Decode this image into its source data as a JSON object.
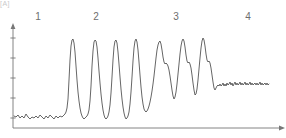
{
  "figure": {
    "corner_mark": "[A]",
    "width": 286,
    "height": 138
  },
  "zone_labels": [
    {
      "text": "1",
      "x": 38
    },
    {
      "text": "2",
      "x": 96
    },
    {
      "text": "3",
      "x": 176
    },
    {
      "text": "4",
      "x": 248
    }
  ],
  "axes": {
    "line_color": "#777777",
    "y_axis": {
      "x": 13,
      "top": 27,
      "bottom": 128
    },
    "x_axis": {
      "y": 128,
      "left": 13,
      "right": 281
    },
    "y_ticks": [
      38,
      58,
      78,
      98,
      118
    ],
    "arrowheads": true
  },
  "trace": {
    "color": "#555555",
    "width": 0.9
  },
  "chart_data": {
    "type": "line",
    "title": "",
    "xlabel": "",
    "ylabel": "",
    "grid": false,
    "legend": null,
    "annotations": [
      {
        "label": "1",
        "x": 38,
        "description": "baseline region"
      },
      {
        "label": "2",
        "x": 96,
        "description": "first peak group"
      },
      {
        "label": "3",
        "x": 176,
        "description": "second peak group"
      },
      {
        "label": "4",
        "x": 248,
        "description": "elevated plateau region"
      }
    ],
    "axis_pixel_ranges": {
      "x": [
        13,
        281
      ],
      "y_top": 27,
      "y_baseline": 128
    },
    "series": [
      {
        "name": "trace",
        "points": [
          [
            14,
            116
          ],
          [
            16,
            117
          ],
          [
            18,
            115
          ],
          [
            20,
            118
          ],
          [
            22,
            116
          ],
          [
            24,
            118
          ],
          [
            26,
            114
          ],
          [
            28,
            117
          ],
          [
            30,
            119
          ],
          [
            32,
            117
          ],
          [
            34,
            118
          ],
          [
            36,
            116
          ],
          [
            38,
            118
          ],
          [
            40,
            115
          ],
          [
            42,
            117
          ],
          [
            44,
            119
          ],
          [
            46,
            116
          ],
          [
            48,
            118
          ],
          [
            50,
            115
          ],
          [
            52,
            117
          ],
          [
            54,
            119
          ],
          [
            56,
            116
          ],
          [
            58,
            118
          ],
          [
            60,
            116
          ],
          [
            62,
            117
          ],
          [
            64,
            115
          ],
          [
            65,
            114
          ],
          [
            66,
            112
          ],
          [
            67,
            108
          ],
          [
            68,
            99
          ],
          [
            69,
            80
          ],
          [
            70,
            60
          ],
          [
            71,
            46
          ],
          [
            72,
            40
          ],
          [
            73,
            39
          ],
          [
            74,
            43
          ],
          [
            75,
            52
          ],
          [
            76,
            66
          ],
          [
            77,
            80
          ],
          [
            78,
            92
          ],
          [
            79,
            101
          ],
          [
            80,
            108
          ],
          [
            81,
            113
          ],
          [
            82,
            116
          ],
          [
            83,
            118
          ],
          [
            84,
            119
          ],
          [
            85,
            118
          ],
          [
            86,
            117
          ],
          [
            87,
            116
          ],
          [
            88,
            114
          ],
          [
            89,
            110
          ],
          [
            90,
            101
          ],
          [
            91,
            86
          ],
          [
            92,
            66
          ],
          [
            93,
            51
          ],
          [
            94,
            42
          ],
          [
            95,
            40
          ],
          [
            96,
            41
          ],
          [
            97,
            47
          ],
          [
            98,
            58
          ],
          [
            99,
            71
          ],
          [
            100,
            83
          ],
          [
            101,
            94
          ],
          [
            102,
            103
          ],
          [
            103,
            110
          ],
          [
            104,
            115
          ],
          [
            105,
            118
          ],
          [
            106,
            119
          ],
          [
            107,
            118
          ],
          [
            108,
            116
          ],
          [
            109,
            112
          ],
          [
            110,
            105
          ],
          [
            111,
            93
          ],
          [
            112,
            77
          ],
          [
            113,
            60
          ],
          [
            114,
            47
          ],
          [
            115,
            41
          ],
          [
            116,
            40
          ],
          [
            117,
            43
          ],
          [
            118,
            52
          ],
          [
            119,
            64
          ],
          [
            120,
            77
          ],
          [
            121,
            89
          ],
          [
            122,
            99
          ],
          [
            123,
            107
          ],
          [
            124,
            113
          ],
          [
            125,
            117
          ],
          [
            126,
            119
          ],
          [
            127,
            118
          ],
          [
            128,
            116
          ],
          [
            129,
            112
          ],
          [
            130,
            104
          ],
          [
            131,
            92
          ],
          [
            132,
            77
          ],
          [
            133,
            61
          ],
          [
            134,
            48
          ],
          [
            135,
            41
          ],
          [
            136,
            39
          ],
          [
            137,
            42
          ],
          [
            138,
            50
          ],
          [
            139,
            62
          ],
          [
            140,
            75
          ],
          [
            141,
            87
          ],
          [
            142,
            97
          ],
          [
            143,
            104
          ],
          [
            144,
            109
          ],
          [
            145,
            111
          ],
          [
            146,
            112
          ],
          [
            147,
            111
          ],
          [
            148,
            109
          ],
          [
            149,
            106
          ],
          [
            150,
            102
          ],
          [
            151,
            97
          ],
          [
            152,
            91
          ],
          [
            153,
            84
          ],
          [
            154,
            76
          ],
          [
            155,
            67
          ],
          [
            156,
            58
          ],
          [
            157,
            50
          ],
          [
            158,
            45
          ],
          [
            159,
            42
          ],
          [
            160,
            41
          ],
          [
            161,
            44
          ],
          [
            162,
            50
          ],
          [
            163,
            57
          ],
          [
            164,
            62
          ],
          [
            165,
            64
          ],
          [
            166,
            63
          ],
          [
            167,
            64
          ],
          [
            168,
            66
          ],
          [
            169,
            70
          ],
          [
            170,
            76
          ],
          [
            171,
            83
          ],
          [
            172,
            90
          ],
          [
            173,
            96
          ],
          [
            174,
            99
          ],
          [
            175,
            97
          ],
          [
            176,
            92
          ],
          [
            177,
            84
          ],
          [
            178,
            74
          ],
          [
            179,
            64
          ],
          [
            180,
            54
          ],
          [
            181,
            46
          ],
          [
            182,
            41
          ],
          [
            183,
            39
          ],
          [
            184,
            41
          ],
          [
            185,
            47
          ],
          [
            186,
            55
          ],
          [
            187,
            61
          ],
          [
            188,
            63
          ],
          [
            189,
            62
          ],
          [
            190,
            64
          ],
          [
            191,
            68
          ],
          [
            192,
            75
          ],
          [
            193,
            83
          ],
          [
            194,
            90
          ],
          [
            195,
            95
          ],
          [
            196,
            94
          ],
          [
            197,
            89
          ],
          [
            198,
            80
          ],
          [
            199,
            69
          ],
          [
            200,
            58
          ],
          [
            201,
            48
          ],
          [
            202,
            41
          ],
          [
            203,
            38
          ],
          [
            204,
            40
          ],
          [
            205,
            46
          ],
          [
            206,
            54
          ],
          [
            207,
            60
          ],
          [
            208,
            62
          ],
          [
            209,
            61
          ],
          [
            210,
            63
          ],
          [
            211,
            68
          ],
          [
            212,
            75
          ],
          [
            213,
            82
          ],
          [
            214,
            88
          ],
          [
            215,
            90
          ],
          [
            216,
            88
          ],
          [
            217,
            86
          ],
          [
            218,
            85
          ],
          [
            219,
            86
          ],
          [
            220,
            84
          ],
          [
            221,
            86
          ],
          [
            222,
            85
          ],
          [
            223,
            83
          ],
          [
            224,
            86
          ],
          [
            225,
            84
          ],
          [
            226,
            86
          ],
          [
            227,
            83
          ],
          [
            228,
            85
          ],
          [
            229,
            84
          ],
          [
            230,
            82
          ],
          [
            231,
            85
          ],
          [
            232,
            83
          ],
          [
            233,
            86
          ],
          [
            234,
            84
          ],
          [
            235,
            82
          ],
          [
            236,
            85
          ],
          [
            237,
            83
          ],
          [
            238,
            85
          ],
          [
            239,
            84
          ],
          [
            240,
            82
          ],
          [
            241,
            85
          ],
          [
            242,
            83
          ],
          [
            243,
            85
          ],
          [
            244,
            84
          ],
          [
            245,
            82
          ],
          [
            246,
            85
          ],
          [
            247,
            83
          ],
          [
            248,
            85
          ],
          [
            249,
            84
          ],
          [
            250,
            82
          ],
          [
            251,
            85
          ],
          [
            252,
            83
          ],
          [
            253,
            85
          ],
          [
            254,
            84
          ],
          [
            255,
            83
          ],
          [
            256,
            85
          ],
          [
            257,
            83
          ],
          [
            258,
            85
          ],
          [
            259,
            84
          ],
          [
            260,
            82
          ],
          [
            261,
            85
          ],
          [
            262,
            83
          ],
          [
            263,
            85
          ],
          [
            264,
            84
          ],
          [
            265,
            83
          ],
          [
            266,
            85
          ],
          [
            267,
            83
          ],
          [
            268,
            85
          ],
          [
            269,
            84
          ]
        ]
      }
    ]
  }
}
